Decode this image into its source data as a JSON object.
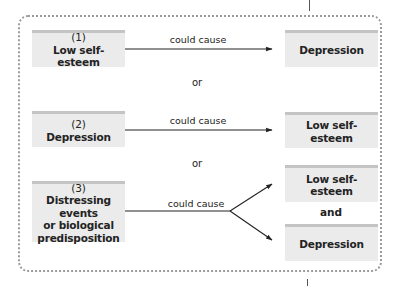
{
  "diagram": {
    "type": "causal-alternatives",
    "rows": [
      {
        "cause": {
          "number": "(1)",
          "label": "Low self-esteem"
        },
        "relation": "could cause",
        "effects": [
          "Depression"
        ]
      },
      {
        "cause": {
          "number": "(2)",
          "label": "Depression"
        },
        "relation": "could cause",
        "effects": [
          "Low self-esteem"
        ]
      },
      {
        "cause": {
          "number": "(3)",
          "label_lines": [
            "Distressing events",
            "or biological",
            "predisposition"
          ]
        },
        "relation": "could cause",
        "effects": [
          "Low self-esteem",
          "Depression"
        ],
        "effects_joiner": "and"
      }
    ],
    "separators": [
      "or",
      "or"
    ]
  },
  "colors": {
    "box_fill": "#ebebeb",
    "box_top_stripe": "#c4c4c4",
    "frame_dots": "#9a9a9a",
    "arrow": "#222222"
  }
}
